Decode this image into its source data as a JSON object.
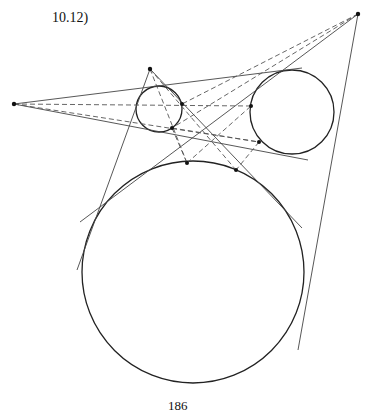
{
  "figure": {
    "label": "10.12)",
    "page_number": "186"
  },
  "points": {
    "A": [
      14,
      104
    ],
    "B": [
      150,
      69
    ],
    "C": [
      358,
      14
    ]
  },
  "circles": {
    "small": {
      "cx": 159,
      "cy": 109,
      "r": 23
    },
    "right": {
      "cx": 292,
      "cy": 112,
      "r": 42
    },
    "big": {
      "cx": 193,
      "cy": 272,
      "r": 111
    }
  },
  "tangent_points": {
    "small": [
      [
        182,
        104
      ],
      [
        172,
        128
      ]
    ],
    "right": [
      [
        251,
        106
      ],
      [
        259,
        142
      ]
    ],
    "big": [
      [
        187,
        163
      ],
      [
        236,
        170
      ]
    ]
  },
  "colors": {
    "stroke": "#222222",
    "thin": "#444444"
  }
}
